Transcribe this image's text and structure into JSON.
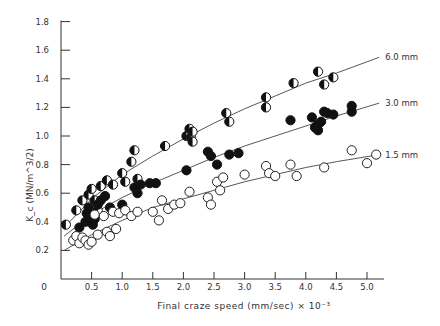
{
  "chart_data": {
    "type": "scatter",
    "title": "",
    "xlabel": "Final  craze  speed  (mm/sec) × 10⁻³",
    "ylabel": "K_c  (MN/m^3/2)",
    "xlim": [
      0,
      5.3
    ],
    "ylim": [
      0,
      1.8
    ],
    "x_ticks": [
      0.5,
      1.0,
      1.5,
      2.0,
      2.5,
      3.0,
      3.5,
      4.0,
      4.5,
      5.0
    ],
    "x_tick_labels": [
      "0.5",
      "1.0",
      "1.5",
      "2.0",
      "2.5",
      "3.0",
      "3.5",
      "4.0",
      "4.5",
      "5.0"
    ],
    "y_ticks": [
      0.2,
      0.4,
      0.6,
      0.8,
      1.0,
      1.2,
      1.4,
      1.6,
      1.8
    ],
    "y_tick_labels": [
      "0.2",
      "0.4",
      "0.6",
      "0.8",
      "1.0",
      "1.2",
      "1.4",
      "1.6",
      "1.8"
    ],
    "origin_label": "0",
    "grid": false,
    "legend": "inline curve labels at right",
    "series": [
      {
        "name": "6.0 mm",
        "label": "6.0 mm",
        "marker": "half-filled circle",
        "curve": {
          "x": [
            0.05,
            0.5,
            1.0,
            1.5,
            2.0,
            2.5,
            3.0,
            3.5,
            4.0,
            4.5,
            5.2
          ],
          "y": [
            0.36,
            0.56,
            0.73,
            0.86,
            0.98,
            1.09,
            1.19,
            1.28,
            1.37,
            1.44,
            1.55
          ]
        },
        "points": [
          [
            0.08,
            0.38
          ],
          [
            0.25,
            0.48
          ],
          [
            0.35,
            0.55
          ],
          [
            0.45,
            0.59
          ],
          [
            0.5,
            0.63
          ],
          [
            0.55,
            0.55
          ],
          [
            0.6,
            0.48
          ],
          [
            0.65,
            0.65
          ],
          [
            0.75,
            0.69
          ],
          [
            0.85,
            0.66
          ],
          [
            1.0,
            0.74
          ],
          [
            1.05,
            0.68
          ],
          [
            1.15,
            0.82
          ],
          [
            1.2,
            0.9
          ],
          [
            1.25,
            0.7
          ],
          [
            1.7,
            0.93
          ],
          [
            2.05,
            1.0
          ],
          [
            2.1,
            1.05
          ],
          [
            2.12,
            0.99
          ],
          [
            2.15,
            0.96
          ],
          [
            2.15,
            1.03
          ],
          [
            2.7,
            1.16
          ],
          [
            2.75,
            1.1
          ],
          [
            3.35,
            1.27
          ],
          [
            3.35,
            1.2
          ],
          [
            3.8,
            1.37
          ],
          [
            4.2,
            1.45
          ],
          [
            4.3,
            1.36
          ],
          [
            4.45,
            1.41
          ]
        ]
      },
      {
        "name": "3.0 mm",
        "label": "3.0 mm",
        "marker": "filled circle",
        "curve": {
          "x": [
            0.05,
            0.5,
            1.0,
            1.5,
            2.0,
            2.5,
            3.0,
            3.5,
            4.0,
            4.5,
            5.2
          ],
          "y": [
            0.3,
            0.45,
            0.57,
            0.67,
            0.76,
            0.85,
            0.93,
            1.0,
            1.07,
            1.14,
            1.23
          ]
        },
        "points": [
          [
            0.3,
            0.36
          ],
          [
            0.4,
            0.4
          ],
          [
            0.42,
            0.46
          ],
          [
            0.45,
            0.5
          ],
          [
            0.5,
            0.44
          ],
          [
            0.52,
            0.38
          ],
          [
            0.55,
            0.42
          ],
          [
            0.6,
            0.52
          ],
          [
            0.65,
            0.55
          ],
          [
            0.72,
            0.58
          ],
          [
            0.8,
            0.5
          ],
          [
            1.0,
            0.52
          ],
          [
            1.2,
            0.64
          ],
          [
            1.25,
            0.6
          ],
          [
            1.3,
            0.66
          ],
          [
            1.45,
            0.67
          ],
          [
            1.55,
            0.67
          ],
          [
            2.05,
            0.76
          ],
          [
            2.4,
            0.89
          ],
          [
            2.45,
            0.86
          ],
          [
            2.55,
            0.8
          ],
          [
            2.75,
            0.87
          ],
          [
            2.9,
            0.88
          ],
          [
            3.75,
            1.11
          ],
          [
            4.1,
            1.13
          ],
          [
            4.15,
            1.06
          ],
          [
            4.2,
            1.08
          ],
          [
            4.2,
            1.04
          ],
          [
            4.25,
            1.1
          ],
          [
            4.3,
            1.17
          ],
          [
            4.35,
            1.16
          ],
          [
            4.45,
            1.15
          ],
          [
            4.75,
            1.21
          ],
          [
            4.75,
            1.17
          ]
        ]
      },
      {
        "name": "1.5 mm",
        "label": "1.5 mm",
        "marker": "open circle",
        "curve": {
          "x": [
            0.05,
            0.5,
            1.0,
            1.5,
            2.0,
            2.5,
            3.0,
            3.5,
            4.0,
            4.5,
            5.2
          ],
          "y": [
            0.2,
            0.31,
            0.41,
            0.5,
            0.56,
            0.62,
            0.68,
            0.73,
            0.78,
            0.82,
            0.87
          ]
        },
        "points": [
          [
            0.2,
            0.27
          ],
          [
            0.25,
            0.3
          ],
          [
            0.3,
            0.25
          ],
          [
            0.35,
            0.29
          ],
          [
            0.4,
            0.27
          ],
          [
            0.45,
            0.24
          ],
          [
            0.5,
            0.26
          ],
          [
            0.55,
            0.45
          ],
          [
            0.6,
            0.31
          ],
          [
            0.7,
            0.44
          ],
          [
            0.75,
            0.33
          ],
          [
            0.8,
            0.3
          ],
          [
            0.85,
            0.47
          ],
          [
            0.9,
            0.35
          ],
          [
            0.95,
            0.46
          ],
          [
            1.05,
            0.48
          ],
          [
            1.15,
            0.44
          ],
          [
            1.25,
            0.47
          ],
          [
            1.5,
            0.47
          ],
          [
            1.6,
            0.41
          ],
          [
            1.65,
            0.55
          ],
          [
            1.75,
            0.49
          ],
          [
            1.85,
            0.52
          ],
          [
            1.95,
            0.53
          ],
          [
            2.1,
            0.61
          ],
          [
            2.4,
            0.57
          ],
          [
            2.45,
            0.52
          ],
          [
            2.55,
            0.68
          ],
          [
            2.6,
            0.62
          ],
          [
            2.65,
            0.71
          ],
          [
            3.0,
            0.73
          ],
          [
            3.35,
            0.79
          ],
          [
            3.4,
            0.74
          ],
          [
            3.5,
            0.72
          ],
          [
            3.75,
            0.8
          ],
          [
            3.85,
            0.72
          ],
          [
            4.3,
            0.78
          ],
          [
            4.75,
            0.9
          ],
          [
            5.0,
            0.81
          ],
          [
            5.15,
            0.87
          ]
        ]
      }
    ]
  }
}
